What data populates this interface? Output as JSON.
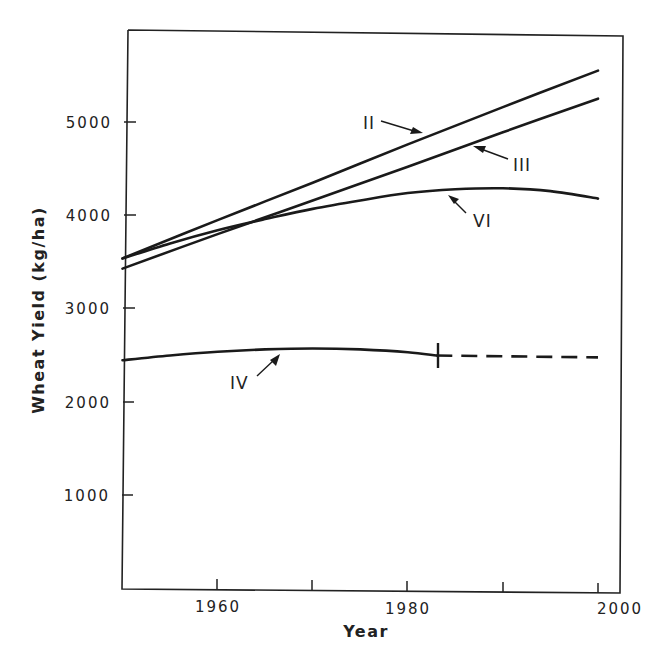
{
  "chart_data": {
    "type": "line",
    "title": "",
    "xlabel": "Year",
    "ylabel": "Wheat Yield (kg/ha)",
    "xlim": [
      1950,
      2000
    ],
    "ylim": [
      0,
      5700
    ],
    "x_ticks": [
      1960,
      1970,
      1980,
      1990,
      2000
    ],
    "x_tick_labels": [
      "1960",
      "",
      "1980",
      "",
      "2000"
    ],
    "y_ticks": [
      1000,
      2000,
      3000,
      4000,
      5000
    ],
    "y_tick_labels": [
      "1000",
      "2000",
      "3000",
      "4000",
      "5000"
    ],
    "grid": false,
    "legend": "none (series labeled inline with arrows)",
    "series": [
      {
        "name": "II",
        "style": "solid",
        "x": [
          1950,
          1960,
          1970,
          1980,
          1990,
          2000
        ],
        "values": [
          3540,
          3950,
          4350,
          4760,
          5160,
          5550
        ]
      },
      {
        "name": "III",
        "style": "solid",
        "x": [
          1950,
          1960,
          1970,
          1980,
          1990,
          2000
        ],
        "values": [
          3430,
          3800,
          4160,
          4520,
          4890,
          5250
        ]
      },
      {
        "name": "VI",
        "style": "solid",
        "x": [
          1950,
          1955,
          1960,
          1965,
          1970,
          1975,
          1980,
          1985,
          1990,
          1995,
          2000
        ],
        "values": [
          3540,
          3700,
          3840,
          3960,
          4070,
          4160,
          4240,
          4280,
          4290,
          4260,
          4180
        ]
      },
      {
        "name": "IV",
        "style": "solid",
        "x": [
          1950,
          1955,
          1960,
          1965,
          1970,
          1975,
          1980,
          1983
        ],
        "values": [
          2450,
          2500,
          2540,
          2565,
          2575,
          2565,
          2535,
          2500
        ]
      },
      {
        "name": "IV (projected)",
        "style": "dashed",
        "x": [
          1983,
          2000
        ],
        "values": [
          2500,
          2480
        ]
      }
    ],
    "annotations": [
      {
        "text": "II",
        "points_to_series": "II",
        "near_x": 1978
      },
      {
        "text": "III",
        "points_to_series": "III",
        "near_x": 1983
      },
      {
        "text": "VI",
        "points_to_series": "VI",
        "near_x": 1975
      },
      {
        "text": "IV",
        "points_to_series": "IV",
        "near_x": 1967
      },
      {
        "text": "|",
        "description": "vertical tick marking end of solid IV curve at ~1983"
      }
    ]
  },
  "labels": {
    "xlabel": "Year",
    "ylabel": "Wheat Yield (kg/ha)",
    "x_ticks": {
      "t1960": "1960",
      "t1980": "1980",
      "t2000": "2000"
    },
    "y_ticks": {
      "t1000": "1000",
      "t2000": "2000",
      "t3000": "3000",
      "t4000": "4000",
      "t5000": "5000"
    },
    "series": {
      "II": "II",
      "III": "III",
      "VI": "VI",
      "IV": "IV"
    }
  }
}
